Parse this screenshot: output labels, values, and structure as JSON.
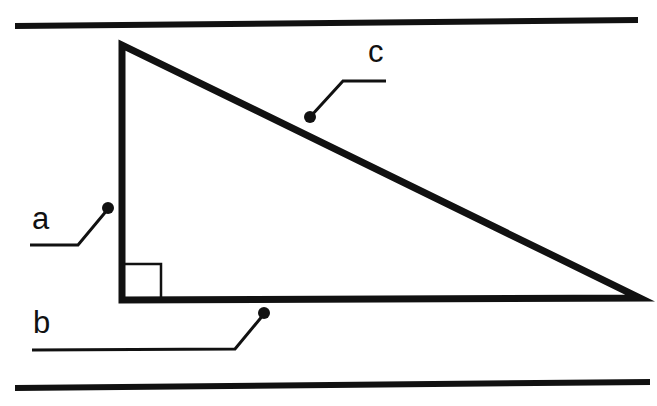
{
  "figure": {
    "kind": "geometry-diagram",
    "background_color": "#ffffff",
    "ink_color": "#111111",
    "canvas": {
      "width": 657,
      "height": 406
    },
    "rules": [
      {
        "name": "top-rule",
        "x1": 15,
        "y1": 26,
        "x2": 638,
        "y2": 20,
        "stroke_width": 6
      },
      {
        "name": "bottom-rule",
        "x1": 15,
        "y1": 388,
        "x2": 650,
        "y2": 382,
        "stroke_width": 6
      }
    ],
    "triangle": {
      "name": "right-triangle",
      "stroke_width": 7,
      "vertices": {
        "apex": {
          "x": 122,
          "y": 45
        },
        "right_angle": {
          "x": 122,
          "y": 300
        },
        "far": {
          "x": 640,
          "y": 298
        }
      },
      "points": "122,45 122,300 640,298"
    },
    "right_angle_marker": {
      "name": "right-angle-square",
      "x": 122,
      "y": 264,
      "size": 39,
      "stroke_width": 2.5,
      "points": "161,300 161,264 122,264"
    },
    "labels": [
      {
        "id": "a",
        "text": "a",
        "text_x": 32,
        "text_y": 229,
        "leader": {
          "polyline": "30,245 78,245 108,209",
          "stroke_width": 3,
          "dot": {
            "x": 108,
            "y": 208,
            "r": 6
          }
        }
      },
      {
        "id": "b",
        "text": "b",
        "text_x": 33,
        "text_y": 333,
        "leader": {
          "polyline": "32,350 235,349 264,314",
          "stroke_width": 3,
          "dot": {
            "x": 264,
            "y": 313,
            "r": 6
          }
        }
      },
      {
        "id": "c",
        "text": "c",
        "text_x": 368,
        "text_y": 62,
        "leader": {
          "polyline": "386,81 343,81 311,116",
          "stroke_width": 3,
          "dot": {
            "x": 310,
            "y": 117,
            "r": 6
          }
        }
      }
    ]
  }
}
